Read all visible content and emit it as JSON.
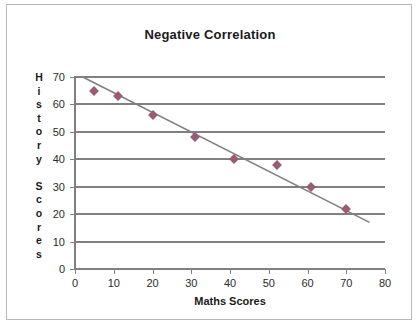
{
  "chart_data": {
    "type": "scatter",
    "title": "Negative Correlation",
    "xlabel": "Maths Scores",
    "ylabel": "History Scores",
    "ylabel_letters": [
      "H",
      "i",
      "s",
      "t",
      "o",
      "r",
      "y",
      "",
      "S",
      "c",
      "o",
      "r",
      "e",
      "s"
    ],
    "xlim": [
      0,
      80
    ],
    "ylim": [
      0,
      70
    ],
    "xticks": [
      0,
      10,
      20,
      30,
      40,
      50,
      60,
      70,
      80
    ],
    "yticks": [
      0,
      10,
      20,
      30,
      40,
      50,
      60,
      70
    ],
    "grid": "horizontal",
    "legend": "none",
    "points": [
      {
        "x": 5,
        "y": 65
      },
      {
        "x": 11,
        "y": 63
      },
      {
        "x": 20,
        "y": 56
      },
      {
        "x": 31,
        "y": 48
      },
      {
        "x": 41,
        "y": 40
      },
      {
        "x": 52,
        "y": 38
      },
      {
        "x": 61,
        "y": 30
      },
      {
        "x": 70,
        "y": 22
      }
    ],
    "trendline": {
      "x0": 2,
      "y0": 70,
      "x1": 76,
      "y1": 17
    },
    "colors": {
      "marker": "#9a5b76",
      "gridline": "#808080",
      "trendline": "#808080",
      "border": "#b9b9b9",
      "text": "#1a1a1a"
    }
  }
}
